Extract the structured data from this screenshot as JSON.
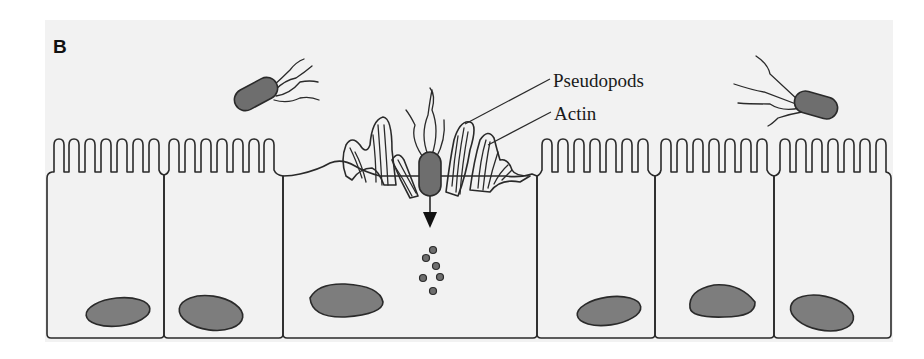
{
  "figure": {
    "panel_label": "B",
    "labels": {
      "pseudopods": "Pseudopods",
      "actin": "Actin"
    },
    "colors": {
      "page_background": "#ffffff",
      "panel_background": "#f2f2f2",
      "cell_fill": "#e3e3e3",
      "nucleus_fill": "#7d7d7d",
      "bacterium_fill": "#6e6e6e",
      "outline": "#2a2a2a"
    },
    "cells": [
      {
        "id": 1,
        "x_left": 47,
        "x_right": 164,
        "microvilli": 7,
        "state": "normal"
      },
      {
        "id": 2,
        "x_left": 164,
        "x_right": 283,
        "microvilli": 7,
        "state": "normal"
      },
      {
        "id": 3,
        "x_left": 283,
        "x_right": 537,
        "microvilli": 0,
        "state": "invaded-with-pseudopods"
      },
      {
        "id": 4,
        "x_left": 537,
        "x_right": 655,
        "microvilli": 7,
        "state": "normal"
      },
      {
        "id": 5,
        "x_left": 655,
        "x_right": 774,
        "microvilli": 7,
        "state": "normal"
      },
      {
        "id": 6,
        "x_left": 774,
        "x_right": 891,
        "microvilli": 7,
        "state": "normal"
      }
    ],
    "bacteria": [
      {
        "id": "free-left",
        "description": "flagellated rod approaching epithelium"
      },
      {
        "id": "entering",
        "description": "rod engulfed by pseudopods, arrow points into cell"
      },
      {
        "id": "free-right",
        "description": "flagellated rod approaching epithelium"
      }
    ],
    "vesicle_count": 6
  }
}
